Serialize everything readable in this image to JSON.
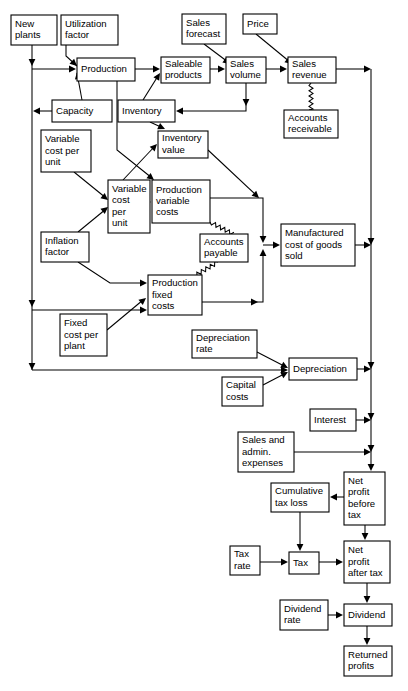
{
  "diagram": {
    "type": "flowchart",
    "nodes": [
      {
        "id": "new_plants",
        "label": [
          "New",
          "plants"
        ],
        "x": 11,
        "y": 15,
        "w": 46,
        "h": 30
      },
      {
        "id": "utilization",
        "label": [
          "Utilization",
          "factor"
        ],
        "x": 61,
        "y": 15,
        "w": 57,
        "h": 30
      },
      {
        "id": "sales_forecast",
        "label": [
          "Sales",
          "forecast"
        ],
        "x": 182,
        "y": 14,
        "w": 44,
        "h": 30
      },
      {
        "id": "price",
        "label": [
          "Price"
        ],
        "x": 243,
        "y": 14,
        "w": 34,
        "h": 20
      },
      {
        "id": "production",
        "label": [
          "Production"
        ],
        "x": 77,
        "y": 58,
        "w": 58,
        "h": 23
      },
      {
        "id": "saleable",
        "label": [
          "Saleable",
          "products"
        ],
        "x": 161,
        "y": 57,
        "w": 49,
        "h": 26
      },
      {
        "id": "sales_volume",
        "label": [
          "Sales",
          "volume"
        ],
        "x": 226,
        "y": 57,
        "w": 40,
        "h": 26
      },
      {
        "id": "sales_revenue",
        "label": [
          "Sales",
          "revenue"
        ],
        "x": 288,
        "y": 57,
        "w": 48,
        "h": 26
      },
      {
        "id": "capacity",
        "label": [
          "Capacity"
        ],
        "x": 52,
        "y": 100,
        "w": 60,
        "h": 22
      },
      {
        "id": "inventory",
        "label": [
          "Inventory"
        ],
        "x": 118,
        "y": 100,
        "w": 57,
        "h": 22
      },
      {
        "id": "accounts_recv",
        "label": [
          "Accounts",
          "receivable"
        ],
        "x": 284,
        "y": 110,
        "w": 54,
        "h": 28
      },
      {
        "id": "var_cost_unit_1",
        "label": [
          "Variable",
          "cost per",
          "unit"
        ],
        "x": 41,
        "y": 130,
        "w": 50,
        "h": 42
      },
      {
        "id": "inventory_value",
        "label": [
          "Inventory",
          "value"
        ],
        "x": 158,
        "y": 131,
        "w": 50,
        "h": 27
      },
      {
        "id": "var_cost_unit_2",
        "label": [
          "Variable",
          "cost",
          "per",
          "unit"
        ],
        "x": 108,
        "y": 180,
        "w": 42,
        "h": 53
      },
      {
        "id": "prod_var_costs",
        "label": [
          "Production",
          "variable",
          "costs"
        ],
        "x": 152,
        "y": 180,
        "w": 58,
        "h": 43
      },
      {
        "id": "inflation",
        "label": [
          "Inflation",
          "factor"
        ],
        "x": 41,
        "y": 232,
        "w": 48,
        "h": 30
      },
      {
        "id": "accounts_pay",
        "label": [
          "Accounts",
          "payable"
        ],
        "x": 200,
        "y": 234,
        "w": 48,
        "h": 28
      },
      {
        "id": "mfg_cost",
        "label": [
          "Manufactured",
          "cost of goods",
          "sold"
        ],
        "x": 281,
        "y": 224,
        "w": 74,
        "h": 42
      },
      {
        "id": "prod_fixed_costs",
        "label": [
          "Production",
          "fixed",
          "costs"
        ],
        "x": 148,
        "y": 275,
        "w": 54,
        "h": 40
      },
      {
        "id": "fixed_cost_plant",
        "label": [
          "Fixed",
          "cost per",
          "plant"
        ],
        "x": 60,
        "y": 314,
        "w": 47,
        "h": 42
      },
      {
        "id": "depreciation_rate",
        "label": [
          "Depreciation",
          "rate"
        ],
        "x": 192,
        "y": 330,
        "w": 65,
        "h": 28
      },
      {
        "id": "depreciation",
        "label": [
          "Depreciation"
        ],
        "x": 289,
        "y": 358,
        "w": 68,
        "h": 22
      },
      {
        "id": "capital_costs",
        "label": [
          "Capital",
          "costs"
        ],
        "x": 222,
        "y": 377,
        "w": 41,
        "h": 29
      },
      {
        "id": "interest",
        "label": [
          "Interest"
        ],
        "x": 310,
        "y": 409,
        "w": 46,
        "h": 22
      },
      {
        "id": "sales_admin",
        "label": [
          "Sales and",
          "admin.",
          "expenses"
        ],
        "x": 238,
        "y": 432,
        "w": 56,
        "h": 40
      },
      {
        "id": "net_profit_before",
        "label": [
          "Net",
          "profit",
          "before",
          "tax"
        ],
        "x": 344,
        "y": 472,
        "w": 41,
        "h": 53
      },
      {
        "id": "cumulative_tax",
        "label": [
          "Cumulative",
          "tax loss"
        ],
        "x": 271,
        "y": 483,
        "w": 58,
        "h": 29
      },
      {
        "id": "tax_rate",
        "label": [
          "Tax",
          "rate"
        ],
        "x": 230,
        "y": 546,
        "w": 30,
        "h": 29
      },
      {
        "id": "tax",
        "label": [
          "Tax"
        ],
        "x": 289,
        "y": 552,
        "w": 30,
        "h": 22
      },
      {
        "id": "net_profit_after",
        "label": [
          "Net",
          "profit",
          "after tax"
        ],
        "x": 344,
        "y": 541,
        "w": 46,
        "h": 42
      },
      {
        "id": "dividend_rate",
        "label": [
          "Dividend",
          "rate"
        ],
        "x": 280,
        "y": 600,
        "w": 48,
        "h": 30
      },
      {
        "id": "dividend",
        "label": [
          "Dividend"
        ],
        "x": 344,
        "y": 604,
        "w": 48,
        "h": 22
      },
      {
        "id": "returned_profits",
        "label": [
          "Returned",
          "profits"
        ],
        "x": 344,
        "y": 646,
        "w": 48,
        "h": 30
      }
    ],
    "edges": [
      {
        "from": "new_plants",
        "to": "production",
        "style": "solid"
      },
      {
        "from": "utilization",
        "to": "production",
        "style": "solid"
      },
      {
        "from": "production",
        "to": "saleable",
        "style": "solid"
      },
      {
        "from": "sales_forecast",
        "to": "sales_volume",
        "style": "solid"
      },
      {
        "from": "saleable",
        "to": "sales_volume",
        "style": "solid"
      },
      {
        "from": "price",
        "to": "sales_revenue",
        "style": "solid"
      },
      {
        "from": "sales_volume",
        "to": "sales_revenue",
        "style": "solid"
      },
      {
        "from": "sales_volume",
        "to": "inventory",
        "style": "solid"
      },
      {
        "from": "sales_revenue",
        "to": "accounts_recv",
        "style": "wavy"
      },
      {
        "from": "sales_revenue",
        "to": "net_profit_before",
        "style": "solid"
      },
      {
        "from": "capacity",
        "to": "production",
        "style": "solid"
      },
      {
        "from": "capacity",
        "to": "new_plants",
        "style": "solid"
      },
      {
        "from": "inventory",
        "to": "saleable",
        "style": "solid"
      },
      {
        "from": "inventory",
        "to": "inventory_value",
        "style": "solid"
      },
      {
        "from": "production",
        "to": "prod_var_costs",
        "style": "solid"
      },
      {
        "from": "var_cost_unit_1",
        "to": "var_cost_unit_2",
        "style": "solid"
      },
      {
        "from": "inflation",
        "to": "var_cost_unit_2",
        "style": "solid"
      },
      {
        "from": "var_cost_unit_2",
        "to": "inventory_value",
        "style": "solid"
      },
      {
        "from": "var_cost_unit_2",
        "to": "prod_var_costs",
        "style": "solid"
      },
      {
        "from": "inventory_value",
        "to": "mfg_cost",
        "style": "solid"
      },
      {
        "from": "prod_var_costs",
        "to": "mfg_cost",
        "style": "solid"
      },
      {
        "from": "prod_var_costs",
        "to": "accounts_pay",
        "style": "wavy"
      },
      {
        "from": "accounts_pay",
        "to": "prod_fixed_costs",
        "style": "wavy"
      },
      {
        "from": "inflation",
        "to": "prod_fixed_costs",
        "style": "solid"
      },
      {
        "from": "fixed_cost_plant",
        "to": "prod_fixed_costs",
        "style": "solid"
      },
      {
        "from": "prod_fixed_costs",
        "to": "mfg_cost",
        "style": "solid"
      },
      {
        "from": "mfg_cost",
        "to": "net_profit_before",
        "style": "solid"
      },
      {
        "from": "depreciation_rate",
        "to": "depreciation",
        "style": "solid"
      },
      {
        "from": "capital_costs",
        "to": "depreciation",
        "style": "solid"
      },
      {
        "from": "depreciation",
        "to": "net_profit_before",
        "style": "solid"
      },
      {
        "from": "interest",
        "to": "net_profit_before",
        "style": "solid"
      },
      {
        "from": "sales_admin",
        "to": "net_profit_before",
        "style": "solid"
      },
      {
        "from": "net_profit_before",
        "to": "cumulative_tax",
        "style": "solid"
      },
      {
        "from": "net_profit_before",
        "to": "net_profit_after",
        "style": "solid"
      },
      {
        "from": "cumulative_tax",
        "to": "tax",
        "style": "solid"
      },
      {
        "from": "tax_rate",
        "to": "tax",
        "style": "solid"
      },
      {
        "from": "tax",
        "to": "net_profit_after",
        "style": "solid"
      },
      {
        "from": "net_profit_after",
        "to": "dividend",
        "style": "solid"
      },
      {
        "from": "dividend_rate",
        "to": "dividend",
        "style": "solid"
      },
      {
        "from": "dividend",
        "to": "returned_profits",
        "style": "solid"
      }
    ],
    "colors": {
      "background": "#ffffff",
      "stroke": "#000000",
      "text": "#000000",
      "box_fill": "#ffffff"
    }
  }
}
